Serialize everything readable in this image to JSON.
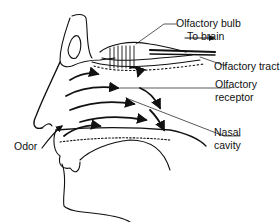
{
  "diagram": {
    "type": "anatomical-illustration",
    "labels": [
      {
        "id": "olfactory_bulb",
        "text": "Olfactory bulb"
      },
      {
        "id": "to_brain",
        "text": "To brain"
      },
      {
        "id": "olfactory_tract",
        "text": "Olfactory tract"
      },
      {
        "id": "olfactory_receptor_line1",
        "text": "Olfactory"
      },
      {
        "id": "olfactory_receptor_line2",
        "text": "receptor"
      },
      {
        "id": "nasal_cavity_line1",
        "text": "Nasal"
      },
      {
        "id": "nasal_cavity_line2",
        "text": "cavity"
      },
      {
        "id": "odor",
        "text": "Odor"
      }
    ],
    "colors": {
      "ink": "#111111",
      "background": "#ffffff",
      "bone_fill": "#eeeeee"
    }
  }
}
